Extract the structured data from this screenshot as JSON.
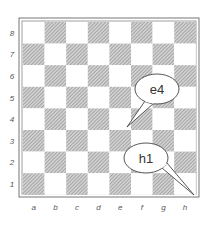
{
  "board": {
    "files": [
      "a",
      "b",
      "c",
      "d",
      "e",
      "f",
      "g",
      "h"
    ],
    "ranks": [
      "8",
      "7",
      "6",
      "5",
      "4",
      "3",
      "2",
      "1"
    ],
    "colors": {
      "light": "#ffffff",
      "dark_hatch": "#b8b8b8",
      "border": "#777777"
    }
  },
  "callouts": [
    {
      "label": "e4",
      "square": "e4"
    },
    {
      "label": "h1",
      "square": "h1"
    }
  ]
}
